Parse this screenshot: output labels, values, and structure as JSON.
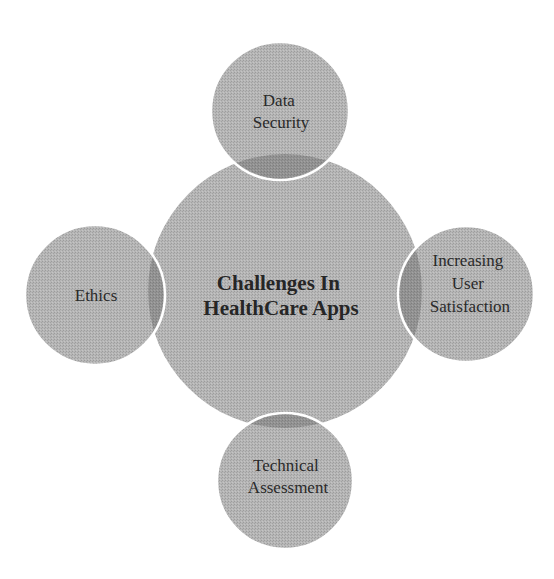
{
  "diagram": {
    "type": "radial-venn",
    "colors": {
      "background": "#ffffff",
      "circle_fill": "#b3b3b3",
      "circle_dither_dark": "#9c9c9c",
      "overlap_fill": "#909090",
      "outline": "#ffffff",
      "text": "#2a2a2a"
    },
    "center": {
      "lines": [
        "Challenges In",
        "HealthCare Apps"
      ],
      "cx": 285,
      "cy": 291,
      "r": 137
    },
    "satellites": [
      {
        "id": "top",
        "lines": [
          "Data",
          "Security"
        ],
        "cx": 280,
        "cy": 111,
        "r": 69
      },
      {
        "id": "right",
        "lines": [
          "Increasing",
          "User",
          "Satisfaction"
        ],
        "cx": 466,
        "cy": 294,
        "r": 68
      },
      {
        "id": "bottom",
        "lines": [
          "Technical",
          "Assessment"
        ],
        "cx": 285,
        "cy": 481,
        "r": 68
      },
      {
        "id": "left",
        "lines": [
          "Ethics"
        ],
        "cx": 95,
        "cy": 295,
        "r": 70
      }
    ]
  }
}
